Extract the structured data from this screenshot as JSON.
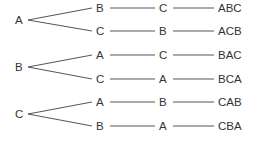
{
  "diagram": {
    "type": "tree",
    "roots": [
      {
        "label": "A",
        "children": [
          {
            "label": "B",
            "child": "C",
            "result": "ABC"
          },
          {
            "label": "C",
            "child": "B",
            "result": "ACB"
          }
        ]
      },
      {
        "label": "B",
        "children": [
          {
            "label": "A",
            "child": "C",
            "result": "BAC"
          },
          {
            "label": "C",
            "child": "A",
            "result": "BCA"
          }
        ]
      },
      {
        "label": "C",
        "children": [
          {
            "label": "A",
            "child": "B",
            "result": "CAB"
          },
          {
            "label": "B",
            "child": "A",
            "result": "CBA"
          }
        ]
      }
    ]
  }
}
